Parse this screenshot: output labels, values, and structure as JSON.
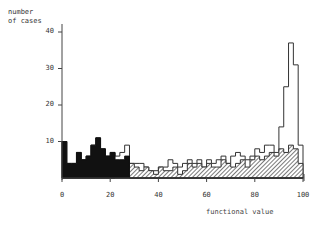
{
  "chart_data": {
    "type": "bar",
    "title": "",
    "xlabel": "functional value",
    "ylabel": "number of cases",
    "xlim": [
      0,
      100
    ],
    "ylim": [
      0,
      45
    ],
    "xticks": [
      0,
      20,
      40,
      60,
      80,
      100
    ],
    "yticks": [
      10,
      20,
      30,
      40
    ],
    "bin_width": 2,
    "grid": false,
    "legend": "none",
    "bin_starts": [
      0,
      2,
      4,
      6,
      8,
      10,
      12,
      14,
      16,
      18,
      20,
      22,
      24,
      26,
      28,
      30,
      32,
      34,
      36,
      38,
      40,
      42,
      44,
      46,
      48,
      50,
      52,
      54,
      56,
      58,
      60,
      62,
      64,
      66,
      68,
      70,
      72,
      74,
      76,
      78,
      80,
      82,
      84,
      86,
      88,
      90,
      92,
      94,
      96,
      98
    ],
    "series": [
      {
        "name": "black (low functional value)",
        "fill": "solid-black",
        "values": [
          10,
          4,
          4,
          7,
          5,
          6,
          9,
          11,
          8,
          6,
          7,
          5,
          5,
          6,
          0,
          0,
          0,
          0,
          0,
          0,
          0,
          0,
          0,
          0,
          0,
          0,
          0,
          0,
          0,
          0,
          0,
          0,
          0,
          0,
          0,
          0,
          0,
          0,
          0,
          0,
          0,
          0,
          0,
          0,
          0,
          0,
          0,
          0,
          0,
          0
        ]
      },
      {
        "name": "hatched",
        "fill": "diagonal-hatch",
        "values": [
          0,
          0,
          0,
          0,
          0,
          0,
          0,
          0,
          0,
          0,
          0,
          1,
          2,
          3,
          4,
          3,
          2,
          3,
          2,
          1,
          3,
          2,
          2,
          3,
          1,
          2,
          4,
          3,
          4,
          3,
          4,
          3,
          3,
          5,
          4,
          3,
          4,
          5,
          3,
          5,
          6,
          5,
          6,
          7,
          6,
          8,
          7,
          9,
          8,
          4
        ]
      },
      {
        "name": "total (open outline)",
        "fill": "none",
        "values": [
          10,
          4,
          4,
          7,
          5,
          6,
          9,
          11,
          8,
          6,
          7,
          6,
          7,
          9,
          4,
          4,
          4,
          3,
          2,
          2,
          3,
          3,
          5,
          4,
          3,
          4,
          5,
          4,
          5,
          3,
          5,
          4,
          5,
          6,
          4,
          6,
          7,
          6,
          5,
          6,
          8,
          7,
          9,
          9,
          7,
          14,
          25,
          37,
          31,
          9
        ]
      }
    ]
  },
  "axes": {
    "ylabel_line1": "number",
    "ylabel_line2": "of cases",
    "yticks": [
      {
        "value": 40,
        "label": "40"
      },
      {
        "value": 30,
        "label": "30"
      },
      {
        "value": 20,
        "label": "20"
      },
      {
        "value": 10,
        "label": "10"
      }
    ],
    "xticks": [
      {
        "value": 0,
        "label": "0"
      },
      {
        "value": 20,
        "label": "20"
      },
      {
        "value": 40,
        "label": "40"
      },
      {
        "value": 60,
        "label": "60"
      },
      {
        "value": 80,
        "label": "80"
      },
      {
        "value": 100,
        "label": "100"
      }
    ],
    "xlabel": "functional value"
  }
}
